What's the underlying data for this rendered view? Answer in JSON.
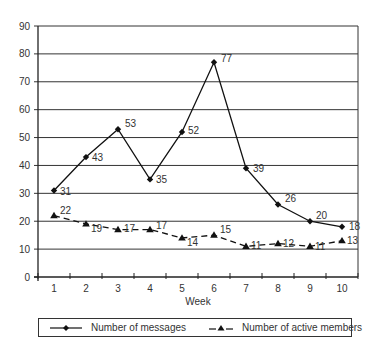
{
  "chart_data": {
    "type": "line",
    "title": "",
    "xlabel": "Week",
    "ylabel": "",
    "x": [
      1,
      2,
      3,
      4,
      5,
      6,
      7,
      8,
      9,
      10
    ],
    "categories": [
      "1",
      "2",
      "3",
      "4",
      "5",
      "6",
      "7",
      "8",
      "9",
      "10"
    ],
    "ylim": [
      0,
      90
    ],
    "yticks": [
      0,
      10,
      20,
      30,
      40,
      50,
      60,
      70,
      80,
      90
    ],
    "grid": true,
    "legend_position": "bottom",
    "series": [
      {
        "name": "Number of messages",
        "values": [
          31,
          43,
          53,
          35,
          52,
          77,
          39,
          26,
          20,
          18
        ],
        "style": "solid",
        "marker": "diamond",
        "color": "#111111"
      },
      {
        "name": "Number of active members",
        "values": [
          22,
          19,
          17,
          17,
          14,
          15,
          11,
          12,
          11,
          13
        ],
        "style": "dashed",
        "marker": "triangle",
        "color": "#111111"
      }
    ]
  },
  "legend": {
    "items": [
      {
        "label": "Number of messages"
      },
      {
        "label": "Number of active members"
      }
    ]
  },
  "axis": {
    "x_title": "Week"
  },
  "colors": {
    "line": "#111111",
    "grid": "#333333",
    "text": "#333333"
  }
}
